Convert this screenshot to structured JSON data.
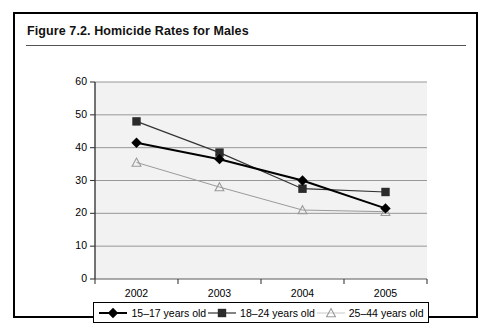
{
  "figure": {
    "title": "Figure 7.2.  Homicide Rates for Males"
  },
  "chart_data": {
    "type": "line",
    "title": "Homicide Rates for Males",
    "xlabel": "",
    "ylabel": "",
    "categories": [
      "2002",
      "2003",
      "2004",
      "2005"
    ],
    "x_tick_labels": [
      "2002",
      "2003",
      "2004",
      "2005"
    ],
    "y_tick_labels": [
      "0",
      "10",
      "20",
      "30",
      "40",
      "50",
      "60"
    ],
    "y_ticks": [
      0,
      10,
      20,
      30,
      40,
      50,
      60
    ],
    "ylim": [
      0,
      60
    ],
    "grid": "horizontal",
    "legend_position": "bottom",
    "plot_background": "#f2f2f2",
    "series": [
      {
        "name": "15–17 years old",
        "marker": "diamond-filled",
        "color": "#000000",
        "line_style": "solid",
        "line_width": 2,
        "values": [
          41.5,
          36.5,
          30,
          21.5
        ]
      },
      {
        "name": "18–24 years old",
        "marker": "square-filled",
        "color": "#333333",
        "line_style": "solid",
        "line_width": 1.2,
        "values": [
          48,
          38.5,
          27.5,
          26.5
        ]
      },
      {
        "name": "25–44 years old",
        "marker": "triangle-open",
        "color": "#9a9a9a",
        "line_style": "solid",
        "line_width": 1,
        "values": [
          35.5,
          28,
          21,
          20.5
        ]
      }
    ]
  },
  "legend": {
    "items": [
      {
        "label": "15–17 years old",
        "marker": "diamond-filled"
      },
      {
        "label": "18–24 years old",
        "marker": "square-filled"
      },
      {
        "label": "25–44 years old",
        "marker": "triangle-open"
      }
    ]
  }
}
